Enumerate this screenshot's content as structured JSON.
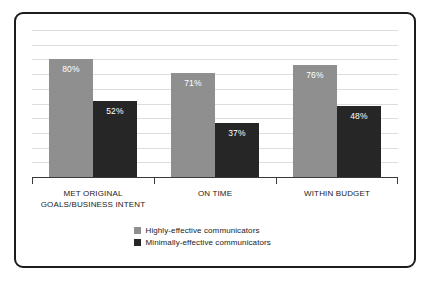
{
  "chart_data": {
    "type": "bar",
    "title": "",
    "subtitle": "",
    "xlabel": "",
    "ylabel": "",
    "ylim": [
      0,
      100
    ],
    "grid": true,
    "gridline_values": [
      10,
      20,
      30,
      40,
      50,
      60,
      70,
      80,
      90,
      100
    ],
    "legend_position": "bottom-center",
    "value_suffix": "%",
    "categories": [
      "MET ORIGINAL GOALS/BUSINESS INTENT",
      "ON TIME",
      "WITHIN BUDGET"
    ],
    "category_lines": [
      [
        "MET ORIGINAL",
        "GOALS/BUSINESS INTENT"
      ],
      [
        "ON TIME",
        ""
      ],
      [
        "WITHIN BUDGET",
        ""
      ]
    ],
    "series": [
      {
        "name": "Highly-effective communicators",
        "color": "#8f8f8f",
        "values": [
          80,
          71,
          76
        ],
        "labels": [
          "80%",
          "71%",
          "76%"
        ]
      },
      {
        "name": "Minimally-effective communicators",
        "color": "#262626",
        "values": [
          52,
          37,
          48
        ],
        "labels": [
          "52%",
          "37%",
          "48%"
        ]
      }
    ]
  },
  "legend": {
    "items": [
      {
        "label": "Highly-effective communicators",
        "color": "#8f8f8f"
      },
      {
        "label": "Minimally-effective communicators",
        "color": "#262626"
      }
    ]
  },
  "frame": {
    "border_color": "#1c1c1c",
    "background": "#ffffff"
  }
}
